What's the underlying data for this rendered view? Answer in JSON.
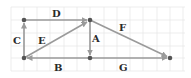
{
  "diagram": {
    "type": "vector-diagram-on-grid",
    "grid": {
      "spacing": 13,
      "color": "#e6e6e6"
    },
    "colors": {
      "vector": "#9a9a9a",
      "point": "#555555",
      "label": "#2a2a2a",
      "background": "#ffffff"
    },
    "points": [
      {
        "id": "P1",
        "x": 24,
        "y": 20
      },
      {
        "id": "P2",
        "x": 90,
        "y": 20
      },
      {
        "id": "P3",
        "x": 24,
        "y": 58
      },
      {
        "id": "P4",
        "x": 90,
        "y": 58
      },
      {
        "id": "P5",
        "x": 170,
        "y": 58
      }
    ],
    "vectors": [
      {
        "label": "D",
        "from": "P1",
        "to": "P2"
      },
      {
        "label": "C",
        "from": "P3",
        "to": "P1"
      },
      {
        "label": "E",
        "from": "P3",
        "to": "P2"
      },
      {
        "label": "A",
        "from": "P2",
        "to": "P4"
      },
      {
        "label": "B",
        "from": "P4",
        "to": "P3"
      },
      {
        "label": "F",
        "from": "P2",
        "to": "P5"
      },
      {
        "label": "G",
        "from": "P4",
        "to": "P5"
      }
    ],
    "labels": {
      "A": "A",
      "B": "B",
      "C": "C",
      "D": "D",
      "E": "E",
      "F": "F",
      "G": "G"
    }
  }
}
